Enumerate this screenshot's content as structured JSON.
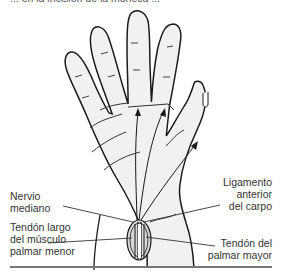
{
  "figure": {
    "caption_fragment": "... en la incisión de la muñeca ...",
    "labels": {
      "median_nerve": [
        "Nervio",
        "mediano"
      ],
      "palmaris_longus": [
        "Tendón largo",
        "del músculo",
        "palmar menor"
      ],
      "carpal_ligament": [
        "Ligamento",
        "anterior",
        "del carpo"
      ],
      "flexor_carpi_radialis": [
        "Tendón del",
        "palmar mayor"
      ]
    },
    "colors": {
      "skin_fill": "#f1f1f1",
      "outline": "#1a1a1a",
      "label_text": "#333333",
      "rule": "#777777"
    }
  }
}
